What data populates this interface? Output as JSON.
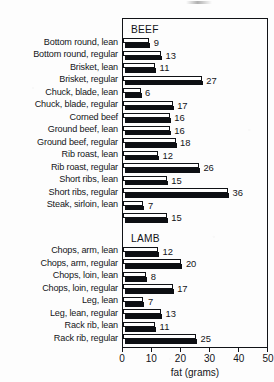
{
  "chart_data": {
    "type": "bar",
    "orientation": "horizontal",
    "title": "",
    "xlabel": "fat (grams)",
    "ylabel": "",
    "xlim": [
      0,
      50
    ],
    "xticks": [
      0,
      10,
      20,
      30,
      40,
      50
    ],
    "xtick_labels": [
      "0",
      "10",
      "20",
      "30",
      "40",
      "50"
    ],
    "grid": false,
    "legend": null,
    "group_captions": [
      "BEEF",
      "LAMB"
    ],
    "groups": [
      {
        "name": "BEEF",
        "categories": [
          "Bottom round, lean",
          "Bottom round, regular",
          "Brisket, lean",
          "Brisket, regular",
          "Chuck, blade, lean",
          "Chuck, blade, regular",
          "Corned beef",
          "Ground beef, lean",
          "Ground beef, regular",
          "Rib roast, lean",
          "Rib roast, regular",
          "Short ribs, lean",
          "Short ribs, regular",
          "Steak, sirloin, lean",
          ""
        ],
        "values": [
          9,
          13,
          11,
          27,
          6,
          17,
          16,
          16,
          18,
          12,
          26,
          15,
          36,
          7,
          15
        ]
      },
      {
        "name": "LAMB",
        "categories": [
          "Chops, arm, lean",
          "Chops, arm, regular",
          "Chops, loin, lean",
          "Chops, loin, regular",
          "Leg, lean",
          "Leg, lean, regular",
          "Rack rib, lean",
          "Rack rib, regular"
        ],
        "values": [
          12,
          20,
          8,
          17,
          7,
          13,
          11,
          25
        ]
      }
    ],
    "categories": [
      "Bottom round, lean",
      "Bottom round, regular",
      "Brisket, lean",
      "Brisket, regular",
      "Chuck, blade, lean",
      "Chuck, blade, regular",
      "Corned beef",
      "Ground beef, lean",
      "Ground beef, regular",
      "Rib roast, lean",
      "Rib roast, regular",
      "Short ribs, lean",
      "Short ribs, regular",
      "Steak, sirloin, lean",
      "",
      "Chops, arm, lean",
      "Chops, arm, regular",
      "Chops, loin, lean",
      "Chops, loin, regular",
      "Leg, lean",
      "Leg, lean, regular",
      "Rack rib, lean",
      "Rack rib, regular"
    ],
    "values": [
      9,
      13,
      11,
      27,
      6,
      17,
      16,
      16,
      18,
      12,
      26,
      15,
      36,
      7,
      15,
      12,
      20,
      8,
      17,
      7,
      13,
      11,
      25
    ]
  },
  "colors": {
    "ink": "#0d0f13",
    "frame": "#111317",
    "bar_fill_top": "#ffffff",
    "bar_fill_bottom": "#0d0f13",
    "paper": "#fdfdfd"
  }
}
